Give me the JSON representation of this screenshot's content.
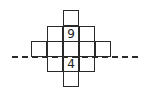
{
  "figure": {
    "type": "net-of-cube-style grid",
    "cells": [
      {
        "row": 0,
        "col": 2,
        "label": ""
      },
      {
        "row": 1,
        "col": 1,
        "label": ""
      },
      {
        "row": 1,
        "col": 2,
        "label": "9"
      },
      {
        "row": 1,
        "col": 3,
        "label": ""
      },
      {
        "row": 2,
        "col": 0,
        "label": ""
      },
      {
        "row": 2,
        "col": 1,
        "label": ""
      },
      {
        "row": 2,
        "col": 2,
        "label": ""
      },
      {
        "row": 2,
        "col": 3,
        "label": ""
      },
      {
        "row": 2,
        "col": 4,
        "label": ""
      },
      {
        "row": 3,
        "col": 1,
        "label": ""
      },
      {
        "row": 3,
        "col": 2,
        "label": "4"
      },
      {
        "row": 3,
        "col": 3,
        "label": ""
      },
      {
        "row": 4,
        "col": 2,
        "label": ""
      }
    ],
    "fold_line": "dashed horizontal line between row 2 and row 3",
    "line_color": "#2a2a2a"
  }
}
